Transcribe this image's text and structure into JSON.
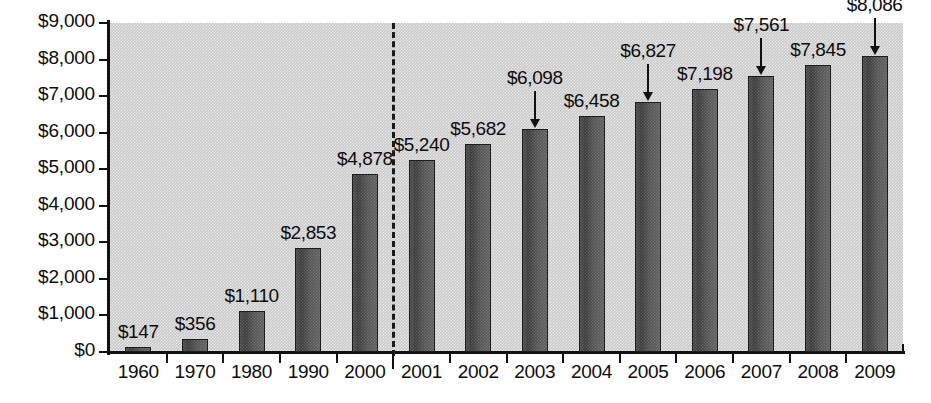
{
  "chart_data": {
    "type": "bar",
    "title": "",
    "subtitle": "",
    "xlabel": "",
    "ylabel": "",
    "categories": [
      "1960",
      "1970",
      "1980",
      "1990",
      "2000",
      "2001",
      "2002",
      "2003",
      "2004",
      "2005",
      "2006",
      "2007",
      "2008",
      "2009"
    ],
    "values": [
      147,
      356,
      1110,
      2853,
      4878,
      5240,
      5682,
      6098,
      6458,
      6827,
      7198,
      7561,
      7845,
      8086
    ],
    "value_labels": [
      "$147",
      "$356",
      "$1,110",
      "$2,853",
      "$4,878",
      "$5,240",
      "$5,682",
      "$6,098",
      "$6,458",
      "$6,827",
      "$7,198",
      "$7,561",
      "$7,845",
      "$8,086"
    ],
    "ylim": [
      0,
      9000
    ],
    "ytick_values": [
      0,
      1000,
      2000,
      3000,
      4000,
      5000,
      6000,
      7000,
      8000,
      9000
    ],
    "ytick_labels": [
      "$0",
      "$1,000",
      "$2,000",
      "$3,000",
      "$4,000",
      "$5,000",
      "$6,000",
      "$7,000",
      "$8,000",
      "$9,000"
    ],
    "grid": false,
    "legend": null,
    "annotations": [
      {
        "name": "divider-dashed-line",
        "after_category": "2000",
        "style": "dashed-vertical"
      },
      {
        "name": "arrow-2003",
        "category": "2003",
        "label": "$6,098",
        "direction": "down"
      },
      {
        "name": "arrow-2005",
        "category": "2005",
        "label": "$6,827",
        "direction": "down"
      },
      {
        "name": "arrow-2007",
        "category": "2007",
        "label": "$7,561",
        "direction": "down"
      },
      {
        "name": "arrow-2009",
        "category": "2009",
        "label": "$8,086",
        "direction": "down"
      }
    ],
    "colors": {
      "bar_fill": "#4a4a4a",
      "bar_border": "#1c1c1c",
      "plot_background": "#c9c9c9",
      "page_background": "#ffffff",
      "text": "#0d0d0d",
      "axis": "#111111"
    }
  }
}
